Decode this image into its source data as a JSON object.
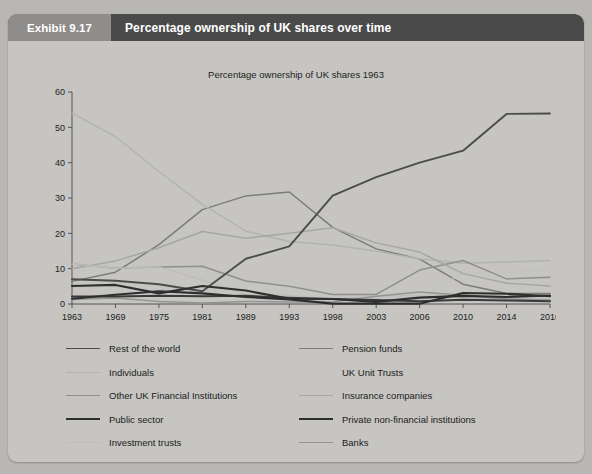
{
  "exhibit": {
    "tag": "Exhibit 9.17",
    "title": "Percentage ownership of UK shares over time"
  },
  "chart_data": {
    "type": "line",
    "title": "Percentage ownership of UK shares 1963",
    "xlabel": "",
    "ylabel": "",
    "x": [
      "1963",
      "1969",
      "1975",
      "1981",
      "1989",
      "1993",
      "1998",
      "2003",
      "2006",
      "2010",
      "2014",
      "2016"
    ],
    "ylim": [
      0,
      60
    ],
    "yticks": [
      0,
      10,
      20,
      30,
      40,
      50,
      60
    ],
    "grid": false,
    "legend_position": "bottom",
    "series": [
      {
        "name": "Rest of the world",
        "color": "#4c4c4c",
        "width": 1.9,
        "values": [
          7.0,
          6.6,
          5.6,
          3.6,
          12.8,
          16.3,
          30.7,
          35.9,
          40.0,
          43.4,
          53.8,
          53.9
        ]
      },
      {
        "name": "Pension funds",
        "color": "#7c7c7c",
        "width": 1.5,
        "values": [
          6.4,
          9.0,
          16.8,
          26.7,
          30.6,
          31.7,
          21.7,
          15.6,
          12.7,
          5.6,
          3.0,
          3.0
        ]
      },
      {
        "name": "Individuals",
        "color": "#b3b3b3",
        "width": 1.5,
        "values": [
          54.0,
          47.4,
          37.5,
          28.2,
          20.6,
          17.7,
          16.7,
          14.9,
          12.8,
          11.5,
          11.9,
          12.3
        ]
      },
      {
        "name": "UK Unit Trusts",
        "color": "#c2c2c2",
        "width": 1.5,
        "values": [
          1.3,
          2.9,
          4.1,
          3.6,
          5.9,
          6.6,
          2.0,
          1.9,
          1.6,
          8.8,
          9.0,
          9.5
        ]
      },
      {
        "name": "Other UK Financial Institutions",
        "color": "#8f8f8f",
        "width": 1.5,
        "values": [
          11.3,
          10.1,
          10.5,
          10.7,
          6.5,
          5.0,
          2.7,
          2.7,
          9.6,
          12.3,
          7.1,
          7.6
        ]
      },
      {
        "name": "Insurance companies",
        "color": "#a6a6a6",
        "width": 1.5,
        "values": [
          10.0,
          12.2,
          15.9,
          20.5,
          18.6,
          20.0,
          21.6,
          17.3,
          14.7,
          8.6,
          5.9,
          5.1
        ]
      },
      {
        "name": "Public sector",
        "color": "#2e2e2e",
        "width": 2.1,
        "values": [
          1.5,
          2.6,
          3.6,
          3.0,
          2.0,
          1.3,
          0.1,
          0.1,
          0.1,
          3.1,
          2.9,
          2.2
        ]
      },
      {
        "name": "Private non-financial institutions",
        "color": "#2e2e2e",
        "width": 2.1,
        "values": [
          5.1,
          5.4,
          3.0,
          5.1,
          3.8,
          1.5,
          1.4,
          0.6,
          1.8,
          2.3,
          2.0,
          2.4
        ]
      },
      {
        "name": "Investment trusts",
        "color": "#bdbdbd",
        "width": 1.5,
        "values": [
          11.3,
          10.1,
          10.5,
          6.8,
          2.7,
          2.5,
          1.3,
          2.2,
          2.4,
          1.8,
          1.5,
          1.3
        ]
      },
      {
        "name": "Banks",
        "color": "#949494",
        "width": 1.5,
        "values": [
          1.3,
          1.7,
          0.7,
          0.3,
          0.7,
          0.6,
          0.6,
          2.2,
          3.4,
          2.5,
          1.4,
          1.1
        ]
      },
      {
        "name": "Charities, church etc",
        "color": "#3a3a3a",
        "width": 2.0,
        "values": [
          2.1,
          2.1,
          2.3,
          2.2,
          2.3,
          1.8,
          1.4,
          1.1,
          0.8,
          1.2,
          1.0,
          0.8
        ]
      }
    ]
  },
  "legend": {
    "left": [
      "Rest of the world",
      "Individuals",
      "Other UK Financial Institutions",
      "Public sector",
      "Investment trusts",
      "Charities, church etc"
    ],
    "right": [
      "Pension funds",
      "UK Unit Trusts",
      "Insurance companies",
      "Private non-financial institutions",
      "Banks"
    ]
  }
}
